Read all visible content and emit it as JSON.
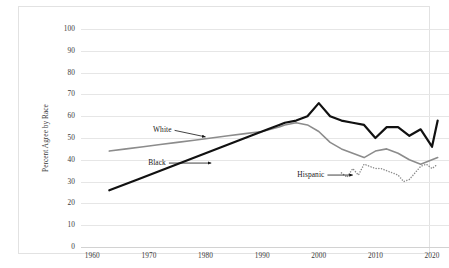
{
  "chart_data": {
    "type": "line",
    "title": "",
    "xlabel": "",
    "ylabel": "Percent Agree by Race",
    "xlim": [
      1958,
      2023
    ],
    "ylim": [
      0,
      100
    ],
    "ytick_labels": [
      "0",
      "10",
      "20",
      "30",
      "40",
      "50",
      "60",
      "70",
      "80",
      "90",
      "100"
    ],
    "ytick_values": [
      0,
      10,
      20,
      30,
      40,
      50,
      60,
      70,
      80,
      90,
      100
    ],
    "xtick_labels": [
      "1960",
      "1970",
      "1980",
      "1990",
      "2000",
      "2010",
      "2020"
    ],
    "xtick_values": [
      1960,
      1970,
      1980,
      1990,
      2000,
      2010,
      2020
    ],
    "grid": "horizontal",
    "legend": "inline-annotations",
    "series": [
      {
        "name": "White",
        "color": "#8c8c8c",
        "style": "solid",
        "width": 1.6,
        "x": [
          1963,
          1966,
          1969,
          1972,
          1975,
          1978,
          1981,
          1984,
          1987,
          1990,
          1993,
          1994,
          1996,
          1998,
          2000,
          2002,
          2004,
          2006,
          2008,
          2010,
          2012,
          2014,
          2016,
          2018,
          2020,
          2021
        ],
        "y": [
          44,
          45,
          46,
          47,
          48,
          49,
          50,
          51,
          52,
          53,
          55,
          56,
          57,
          56,
          53,
          48,
          45,
          43,
          41,
          44,
          45,
          43,
          40,
          38,
          40,
          41
        ]
      },
      {
        "name": "Black",
        "color": "#111111",
        "style": "solid",
        "width": 2.2,
        "x": [
          1963,
          1968,
          1972,
          1976,
          1980,
          1984,
          1988,
          1991,
          1993,
          1994,
          1996,
          1998,
          2000,
          2002,
          2004,
          2006,
          2008,
          2010,
          2012,
          2014,
          2016,
          2018,
          2020,
          2021
        ],
        "y": [
          26,
          31,
          35,
          39,
          43,
          47,
          51,
          54,
          56,
          57,
          58,
          60,
          66,
          60,
          58,
          57,
          56,
          50,
          55,
          55,
          51,
          54,
          46,
          58
        ]
      },
      {
        "name": "Hispanic",
        "color": "#8c8c8c",
        "style": "dotted",
        "width": 1.5,
        "x": [
          2004,
          2005,
          2006,
          2007,
          2008,
          2009,
          2010,
          2011,
          2012,
          2013,
          2014,
          2015,
          2016,
          2017,
          2018,
          2019,
          2020,
          2021
        ],
        "y": [
          34,
          32,
          36,
          33,
          38,
          37,
          36,
          36,
          35,
          34,
          33,
          30,
          31,
          34,
          37,
          38,
          36,
          38
        ]
      }
    ],
    "annotations": [
      {
        "text": "White",
        "x": 1974,
        "y": 53.5,
        "arrow_to_x": 1980,
        "arrow_to_y": 50.5
      },
      {
        "text": "Black",
        "x": 1973,
        "y": 38.5,
        "arrow_to_x": 1981,
        "arrow_to_y": 38.5
      },
      {
        "text": "Hispanic",
        "x": 2001,
        "y": 33.0,
        "arrow_to_x": 2006,
        "arrow_to_y": 33.0
      }
    ]
  }
}
